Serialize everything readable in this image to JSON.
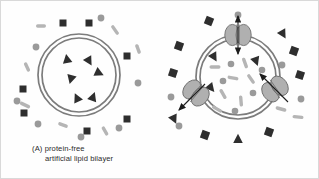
{
  "figure": {
    "background": "#fefefe",
    "border_color": "#d9d9d9"
  },
  "palette": {
    "membrane_gray": "#7c7c7c",
    "protein_fill": "#b0b0b0",
    "protein_stroke": "#6e6e6e",
    "dark_shape": "#2e2e2e",
    "mid_gray": "#9a9a9a",
    "light_gray": "#b5b5b5",
    "caption_color": "#2b2b2b"
  },
  "panels": [
    {
      "id": "A",
      "caption_line1": "(A) protein-free",
      "caption_line2": "artificial lipid bilayer",
      "membrane": {
        "cx": 78,
        "cy": 74,
        "outer_r": 41,
        "inner_r": 37,
        "stroke_width": 1.7
      },
      "interior_triangles": [
        {
          "x": 66,
          "y": 58,
          "rot": -10
        },
        {
          "x": 88,
          "y": 60,
          "rot": 150
        },
        {
          "x": 98,
          "y": 72,
          "rot": 115
        },
        {
          "x": 70,
          "y": 78,
          "rot": 195
        },
        {
          "x": 76,
          "y": 97,
          "rot": -25
        },
        {
          "x": 92,
          "y": 96,
          "rot": 20
        }
      ],
      "exterior_squares": [
        {
          "x": 62,
          "y": 22,
          "s": 7,
          "rot": 0
        },
        {
          "x": 88,
          "y": 22,
          "s": 7,
          "rot": 0
        },
        {
          "x": 126,
          "y": 55,
          "s": 7,
          "rot": 0
        },
        {
          "x": 126,
          "y": 118,
          "s": 7,
          "rot": 0
        },
        {
          "x": 86,
          "y": 130,
          "s": 7,
          "rot": 0
        },
        {
          "x": 23,
          "y": 112,
          "s": 7,
          "rot": 0
        },
        {
          "x": 22,
          "y": 88,
          "s": 7,
          "rot": 0
        }
      ],
      "exterior_dots": [
        {
          "x": 100,
          "y": 17,
          "r": 3.4
        },
        {
          "x": 35,
          "y": 46,
          "r": 3.4
        },
        {
          "x": 137,
          "y": 82,
          "r": 3.4
        },
        {
          "x": 118,
          "y": 127,
          "r": 3.4
        },
        {
          "x": 80,
          "y": 136,
          "r": 3.4
        },
        {
          "x": 37,
          "y": 123,
          "r": 3.4
        },
        {
          "x": 16,
          "y": 100,
          "r": 3.4
        }
      ],
      "exterior_dashes": [
        {
          "x": 40,
          "y": 25,
          "w": 10,
          "h": 3.4,
          "rot": 0
        },
        {
          "x": 114,
          "y": 29,
          "w": 11,
          "h": 3.4,
          "rot": 55
        },
        {
          "x": 137,
          "y": 48,
          "w": 10,
          "h": 3.4,
          "rot": 70
        },
        {
          "x": 26,
          "y": 66,
          "w": 10,
          "h": 3.4,
          "rot": 65
        },
        {
          "x": 24,
          "y": 104,
          "w": 11,
          "h": 3.4,
          "rot": 25
        },
        {
          "x": 62,
          "y": 124,
          "w": 10,
          "h": 3.4,
          "rot": 20
        },
        {
          "x": 104,
          "y": 130,
          "w": 10,
          "h": 3.4,
          "rot": 60
        }
      ]
    },
    {
      "id": "B",
      "caption_line1": "(B) cell membrane",
      "membrane": {
        "cx": 77,
        "cy": 76,
        "outer_r": 42,
        "inner_r": 38,
        "stroke_width": 1.7
      },
      "proteins": [
        {
          "name": "channel-protein-top",
          "x": 77,
          "y": 34,
          "rot": 0,
          "arrow": "double-vertical"
        },
        {
          "name": "channel-protein-left",
          "x": 35,
          "y": 92,
          "rot": 40,
          "arrow": "out-lower-left"
        },
        {
          "name": "channel-protein-right",
          "x": 114,
          "y": 88,
          "rot": -35,
          "arrow": "in-upper-left"
        }
      ],
      "interior_dashes": [
        {
          "x": 54,
          "y": 66,
          "w": 11,
          "h": 3.4,
          "rot": 0
        },
        {
          "x": 84,
          "y": 62,
          "w": 11,
          "h": 3.4,
          "rot": 70
        },
        {
          "x": 72,
          "y": 77,
          "w": 11,
          "h": 3.4,
          "rot": 10
        },
        {
          "x": 90,
          "y": 78,
          "w": 11,
          "h": 3.4,
          "rot": 55
        },
        {
          "x": 62,
          "y": 93,
          "w": 11,
          "h": 3.4,
          "rot": 60
        },
        {
          "x": 80,
          "y": 100,
          "w": 11,
          "h": 3.4,
          "rot": 85
        },
        {
          "x": 56,
          "y": 108,
          "w": 11,
          "h": 3.4,
          "rot": 30
        }
      ],
      "interior_dots": [
        {
          "x": 70,
          "y": 63,
          "r": 3.3
        },
        {
          "x": 62,
          "y": 80,
          "r": 3.3
        },
        {
          "x": 92,
          "y": 92,
          "r": 3.3
        },
        {
          "x": 74,
          "y": 110,
          "r": 3.3
        },
        {
          "x": 101,
          "y": 69,
          "r": 3.3
        }
      ],
      "interior_triangles": [
        {
          "x": 53,
          "y": 56,
          "rot": 150
        },
        {
          "x": 95,
          "y": 60,
          "rot": 160
        },
        {
          "x": 50,
          "y": 87,
          "rot": 140
        }
      ],
      "exterior_squares": [
        {
          "x": 48,
          "y": 20,
          "s": 8,
          "rot": 22
        },
        {
          "x": 18,
          "y": 45,
          "s": 8,
          "rot": 20
        },
        {
          "x": 12,
          "y": 72,
          "s": 8,
          "rot": 18
        },
        {
          "x": 133,
          "y": 50,
          "s": 8,
          "rot": 20
        },
        {
          "x": 139,
          "y": 74,
          "s": 8,
          "rot": 18
        },
        {
          "x": 44,
          "y": 134,
          "s": 8,
          "rot": 20
        },
        {
          "x": 108,
          "y": 131,
          "s": 8,
          "rot": 20
        }
      ],
      "exterior_triangles": [
        {
          "x": 122,
          "y": 33,
          "rot": 150
        },
        {
          "x": 13,
          "y": 118,
          "rot": 155
        },
        {
          "x": 77,
          "y": 138,
          "rot": 0
        }
      ],
      "exterior_dots": [
        {
          "x": 77,
          "y": 14,
          "r": 3.4
        },
        {
          "x": 121,
          "y": 64,
          "r": 3.4
        },
        {
          "x": 140,
          "y": 98,
          "r": 3.4
        },
        {
          "x": 10,
          "y": 96,
          "r": 3.4
        },
        {
          "x": 18,
          "y": 125,
          "r": 3.4
        }
      ],
      "exterior_dashes": [
        {
          "x": 137,
          "y": 116,
          "w": 11,
          "h": 3.4,
          "rot": 5
        },
        {
          "x": 120,
          "y": 108,
          "w": 11,
          "h": 3.4,
          "rot": 15
        }
      ]
    }
  ]
}
